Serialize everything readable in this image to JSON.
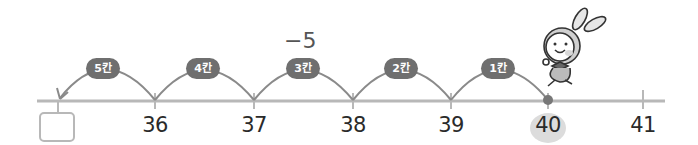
{
  "diagram": {
    "type": "number-line-subtraction",
    "operation_label": "−5",
    "start_value": "40",
    "answer_box": "",
    "ticks": [
      {
        "label": "",
        "x": 58
      },
      {
        "label": "36",
        "x": 155
      },
      {
        "label": "37",
        "x": 254
      },
      {
        "label": "38",
        "x": 353
      },
      {
        "label": "39",
        "x": 451
      },
      {
        "label": "40",
        "x": 548
      },
      {
        "label": "41",
        "x": 643
      }
    ],
    "jumps": [
      {
        "label": "5칸",
        "x": 103
      },
      {
        "label": "4칸",
        "x": 203
      },
      {
        "label": "3칸",
        "x": 303
      },
      {
        "label": "2칸",
        "x": 401
      },
      {
        "label": "1칸",
        "x": 498
      }
    ],
    "colors": {
      "line": "#b5b5b5",
      "arc": "#888888",
      "badge": "#6f6f6f",
      "start_dot": "#777777",
      "highlight": "#dcdcdc"
    },
    "character": "rabbit-mascot"
  }
}
